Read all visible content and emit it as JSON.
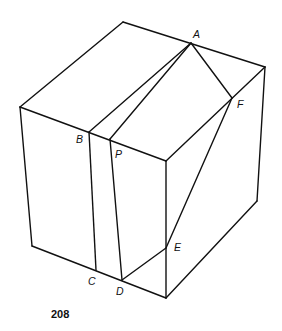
{
  "figure": {
    "page_number": "208",
    "labels": {
      "A": "A",
      "B": "B",
      "C": "C",
      "D": "D",
      "E": "E",
      "F": "F",
      "P": "P"
    },
    "colors": {
      "line": "#111111",
      "background": "#ffffff"
    }
  }
}
